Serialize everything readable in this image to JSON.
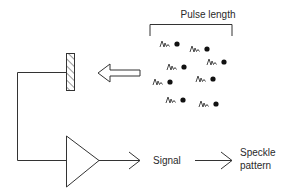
{
  "diagram": {
    "pulse_label": "Pulse length",
    "signal_label": "Signal",
    "speckle_label_line1": "Speckle",
    "speckle_label_line2": "pattern",
    "colors": {
      "stroke": "#333333",
      "background": "#ffffff"
    },
    "icons": {
      "mirror": "hatched-mirror-icon",
      "incoming_arrow": "hollow-left-arrow-icon",
      "amplifier": "amplifier-triangle-icon",
      "scatterer": "squiggle-dot-icon"
    },
    "scatterers": [
      {
        "x": 160,
        "y": 44
      },
      {
        "x": 190,
        "y": 49
      },
      {
        "x": 167,
        "y": 67
      },
      {
        "x": 207,
        "y": 62
      },
      {
        "x": 153,
        "y": 82
      },
      {
        "x": 196,
        "y": 79
      },
      {
        "x": 166,
        "y": 100
      },
      {
        "x": 199,
        "y": 104
      }
    ]
  }
}
